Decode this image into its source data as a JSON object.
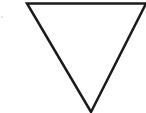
{
  "diagram": {
    "shape": "inverted-triangle",
    "stroke_color": "#1a1a1a",
    "fill_color": "#ffffff",
    "stroke_width": 2.5,
    "points": "27,3.5 146,3.5 91,112",
    "dot": {
      "cx": 2,
      "cy": 17,
      "r": 0.6,
      "color": "#888888"
    }
  }
}
